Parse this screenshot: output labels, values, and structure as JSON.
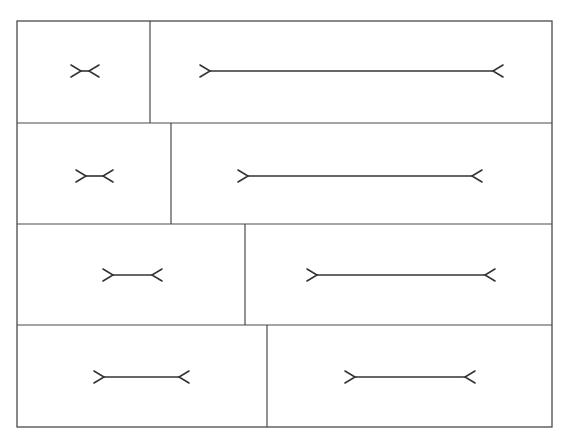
{
  "title": "",
  "figure_type": "Müller-Lyer illusion comparison grid",
  "colors": {
    "line": "#333333",
    "frame": "#4a4a4a",
    "background": "#ffffff"
  },
  "rows": [
    {
      "row": 1,
      "left": {
        "fin_style": "outward",
        "shaft_rel_length": 0.03
      },
      "right": {
        "fin_style": "outward",
        "shaft_rel_length": 1.0
      }
    },
    {
      "row": 2,
      "left": {
        "fin_style": "outward",
        "shaft_rel_length": 0.06
      },
      "right": {
        "fin_style": "outward",
        "shaft_rel_length": 0.8
      }
    },
    {
      "row": 3,
      "left": {
        "fin_style": "outward",
        "shaft_rel_length": 0.14
      },
      "right": {
        "fin_style": "outward",
        "shaft_rel_length": 0.6
      }
    },
    {
      "row": 4,
      "left": {
        "fin_style": "outward",
        "shaft_rel_length": 0.27
      },
      "right": {
        "fin_style": "outward",
        "shaft_rel_length": 0.39
      }
    }
  ]
}
